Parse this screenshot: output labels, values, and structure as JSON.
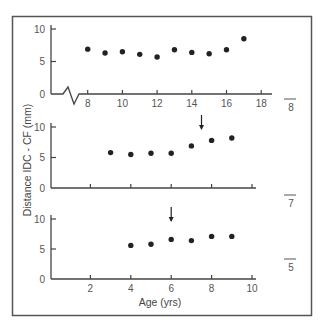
{
  "colors": {
    "axis": "#444444",
    "frame": "#555555",
    "point": "#222222",
    "text": "#555555"
  },
  "chart_data": [
    {
      "type": "scatter",
      "panel_label": "8",
      "x": [
        8,
        9,
        10,
        11,
        12,
        13,
        14,
        15,
        16,
        17
      ],
      "y": [
        6.9,
        6.3,
        6.5,
        6.1,
        5.7,
        6.8,
        6.4,
        6.2,
        6.8,
        8.5
      ],
      "xticks": [
        8,
        10,
        12,
        14,
        16,
        18
      ],
      "yticks": [
        0,
        5,
        10
      ],
      "xlim": [
        7,
        18.6
      ],
      "ylim": [
        0,
        10
      ],
      "axis_break": true,
      "arrow_at_x": null,
      "xlabel": "",
      "grid": false
    },
    {
      "type": "scatter",
      "panel_label": "7",
      "x": [
        3,
        4,
        5,
        6,
        7,
        8,
        9
      ],
      "y": [
        5.8,
        5.5,
        5.7,
        5.7,
        6.9,
        7.8,
        8.2
      ],
      "xticks": [
        2,
        4,
        6,
        8,
        10
      ],
      "yticks": [
        0,
        5,
        10
      ],
      "xlim": [
        0,
        10.2
      ],
      "ylim": [
        0,
        10
      ],
      "axis_break": false,
      "arrow_at_x": 7.5,
      "xlabel": "",
      "grid": false
    },
    {
      "type": "scatter",
      "panel_label": "5",
      "x": [
        4,
        5,
        6,
        7,
        8,
        9
      ],
      "y": [
        5.6,
        5.8,
        6.6,
        6.4,
        7.1,
        7.1
      ],
      "xticks": [
        2,
        4,
        6,
        8,
        10
      ],
      "yticks": [
        0,
        5,
        10
      ],
      "xlim": [
        0,
        10.2
      ],
      "ylim": [
        0,
        10
      ],
      "axis_break": false,
      "arrow_at_x": 6,
      "xlabel": "Age (yrs)",
      "grid": false
    }
  ],
  "labels": {
    "ylabel": "Distance IDC - CF (mm)",
    "xlabel": "Age (yrs)"
  }
}
